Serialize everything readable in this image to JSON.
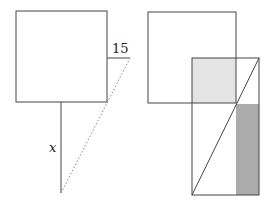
{
  "left_figure": {
    "side_label": "15",
    "height_label": "x",
    "square": {
      "x": 16,
      "y": 11,
      "w": 91,
      "h": 91
    },
    "offset_line": {
      "x1": 107,
      "y1": 58,
      "x2": 130,
      "y2": 58
    },
    "vertical_line": {
      "x1": 61,
      "y1": 102,
      "x2": 61,
      "y2": 193
    },
    "dotted_line": {
      "x1": 61,
      "y1": 193,
      "x2": 130,
      "y2": 58
    }
  },
  "right_figure": {
    "square": {
      "x": 148,
      "y": 12,
      "w": 88,
      "h": 91
    },
    "rectangle": {
      "x": 192,
      "y": 58,
      "w": 67,
      "h": 137
    },
    "light_region": {
      "x": 192,
      "y": 58,
      "w": 44,
      "h": 45
    },
    "dark_region": {
      "x": 236,
      "y": 104,
      "w": 23,
      "h": 91
    },
    "diagonal": {
      "x1": 192,
      "y1": 195,
      "x2": 259,
      "y2": 58
    }
  },
  "colors": {
    "stroke": "#444444",
    "light_fill": "#e4e4e4",
    "dark_fill": "#ababab",
    "dotted": "#888888"
  }
}
